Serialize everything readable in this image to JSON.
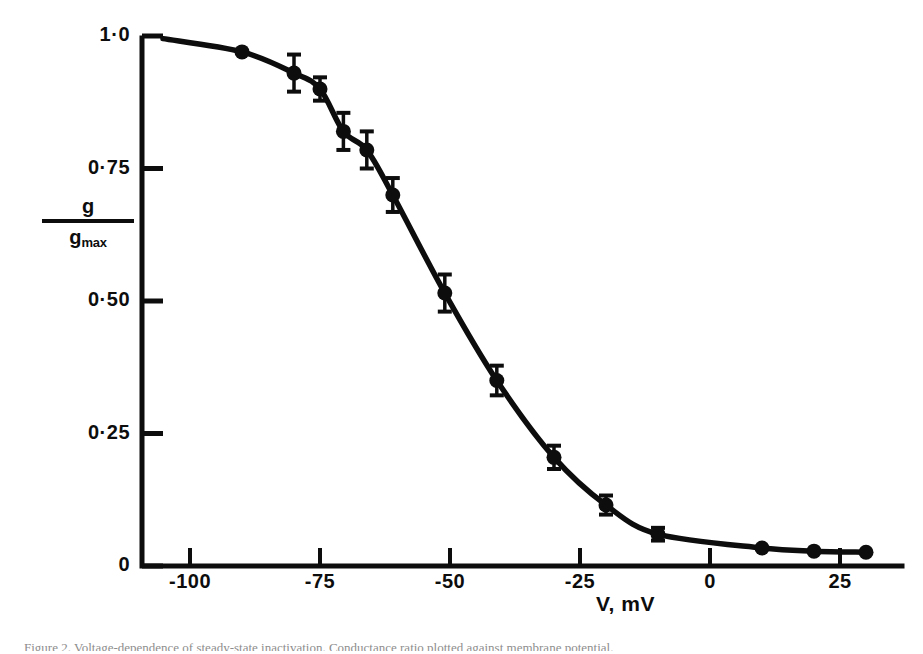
{
  "figure": {
    "kind": "scientific-plot",
    "background_color": "#ffffff",
    "ink_color": "#0d0d0d",
    "caption_fragment": "Figure 2. Voltage-dependence of steady-state inactivation. Conductance ratio plotted against membrane potential."
  },
  "axes": {
    "x": {
      "title": "V, mV",
      "tick_labels": [
        "-100",
        "-75",
        "-50",
        "-25",
        "0",
        "25"
      ],
      "tick_values": [
        -100,
        -75,
        -50,
        -25,
        0,
        25
      ],
      "range": [
        -108,
        30
      ]
    },
    "y": {
      "title_numerator": "g",
      "title_denominator": "g",
      "title_denominator_sub": "max",
      "tick_labels": [
        "1·0",
        "0·75",
        "0·50",
        "0·25",
        "0"
      ],
      "tick_values": [
        1.0,
        0.75,
        0.5,
        0.25,
        0
      ],
      "range": [
        0,
        1.0
      ]
    }
  },
  "chart_data": {
    "type": "scatter",
    "title": "",
    "subtitle": "",
    "xlabel": "V, mV",
    "ylabel": "g/gmax",
    "xlim": [
      -108,
      30
    ],
    "ylim": [
      0,
      1.0
    ],
    "grid": false,
    "legend": "none",
    "marker": "filled-circle",
    "error_bars": "vertical-with-caps",
    "fitted_curve": "sigmoid (Boltzmann) through points, drawn as thick smooth line",
    "x": [
      -90,
      -80,
      -75,
      -70.5,
      -66,
      -61,
      -51,
      -41,
      -30,
      -20,
      -10,
      10,
      20,
      30
    ],
    "y": [
      0.97,
      0.93,
      0.9,
      0.82,
      0.785,
      0.7,
      0.515,
      0.35,
      0.205,
      0.115,
      0.06,
      0.034,
      0.028,
      0.026
    ],
    "yerr": [
      0.0,
      0.035,
      0.022,
      0.035,
      0.035,
      0.032,
      0.035,
      0.028,
      0.022,
      0.018,
      0.012,
      0.0,
      0.0,
      0.0
    ],
    "points": [
      {
        "x": -90,
        "y": 0.97,
        "yerr": 0.0
      },
      {
        "x": -80,
        "y": 0.93,
        "yerr": 0.035
      },
      {
        "x": -75,
        "y": 0.9,
        "yerr": 0.022
      },
      {
        "x": -70.5,
        "y": 0.82,
        "yerr": 0.035
      },
      {
        "x": -66,
        "y": 0.785,
        "yerr": 0.035
      },
      {
        "x": -61,
        "y": 0.7,
        "yerr": 0.032
      },
      {
        "x": -51,
        "y": 0.515,
        "yerr": 0.035
      },
      {
        "x": -41,
        "y": 0.35,
        "yerr": 0.028
      },
      {
        "x": -30,
        "y": 0.205,
        "yerr": 0.022
      },
      {
        "x": -20,
        "y": 0.115,
        "yerr": 0.018
      },
      {
        "x": -10,
        "y": 0.06,
        "yerr": 0.012
      },
      {
        "x": 10,
        "y": 0.034,
        "yerr": 0.0
      },
      {
        "x": 20,
        "y": 0.028,
        "yerr": 0.0
      },
      {
        "x": 30,
        "y": 0.026,
        "yerr": 0.0
      }
    ]
  }
}
